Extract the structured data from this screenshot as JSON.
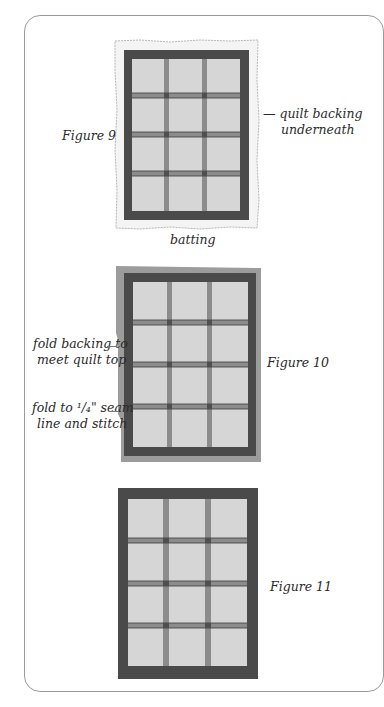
{
  "colors": {
    "frame": "#9a9a9a",
    "batting": "#f4f4f4",
    "batting_edge": "#b5b5b5",
    "backing": "#9c9c9c",
    "border": "#4a4a4a",
    "block": "#d6d6d6",
    "sashing": "#8c8c8c",
    "sashing_line": "#3a3a3a",
    "cornerstone": "#4f4f4f"
  },
  "figures": [
    {
      "id": "figure-9",
      "caption": "Figure 9",
      "labels": {
        "right_line1": "— quilt backing",
        "right_line2": "underneath",
        "bottom": "batting"
      },
      "grid": {
        "rows": 4,
        "cols": 3
      }
    },
    {
      "id": "figure-10",
      "caption": "Figure 10",
      "labels": {
        "left_top_line1": "fold backing to",
        "left_top_line2": "meet quilt top",
        "left_bottom_line1": "fold to ¹/₄\" seam",
        "left_bottom_line2": "line and stitch"
      },
      "grid": {
        "rows": 4,
        "cols": 3
      }
    },
    {
      "id": "figure-11",
      "caption": "Figure 11",
      "grid": {
        "rows": 4,
        "cols": 3
      }
    }
  ]
}
